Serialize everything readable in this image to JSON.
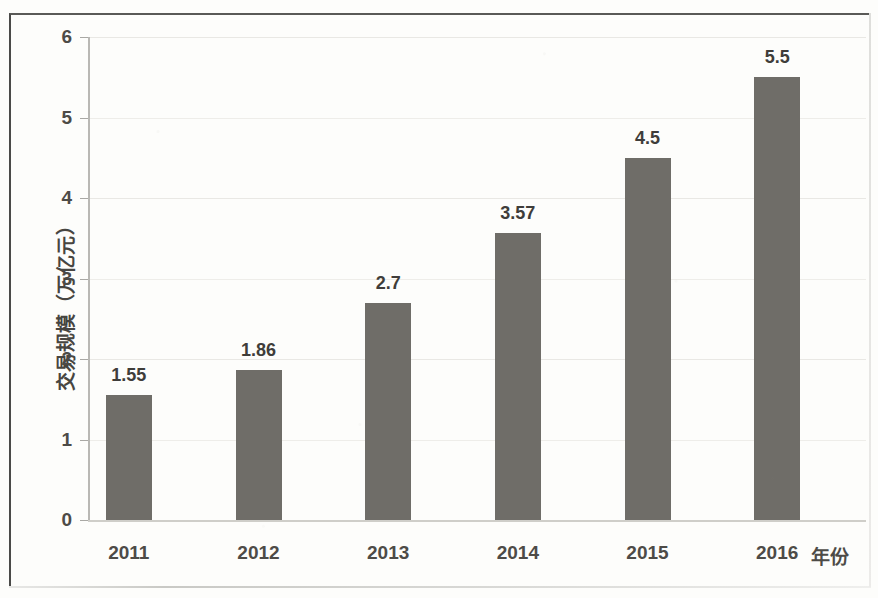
{
  "chart_data": {
    "type": "bar",
    "title": "",
    "subtitle": "",
    "xlabel": "年份",
    "ylabel": "交易规模（万亿元）",
    "categories": [
      "2011",
      "2012",
      "2013",
      "2014",
      "2015",
      "2016"
    ],
    "values": [
      1.55,
      1.86,
      2.7,
      3.57,
      4.5,
      5.5
    ],
    "value_labels": [
      "1.55",
      "1.86",
      "2.7",
      "3.57",
      "4.5",
      "5.5"
    ],
    "ylim": [
      0,
      6
    ],
    "y_ticks": [
      "0",
      "1",
      "2",
      "3",
      "4",
      "5",
      "6"
    ],
    "y_tick_values": [
      0,
      1,
      2,
      3,
      4,
      5,
      6
    ],
    "grid": true,
    "legend": "none",
    "series_name": "交易规模",
    "bar_color": "#6f6d68",
    "text_color": "#4d4b47",
    "grid_color": "#e9e8e4",
    "axis_color": "#b9b8b4",
    "background_color": "#fdfdfb"
  }
}
